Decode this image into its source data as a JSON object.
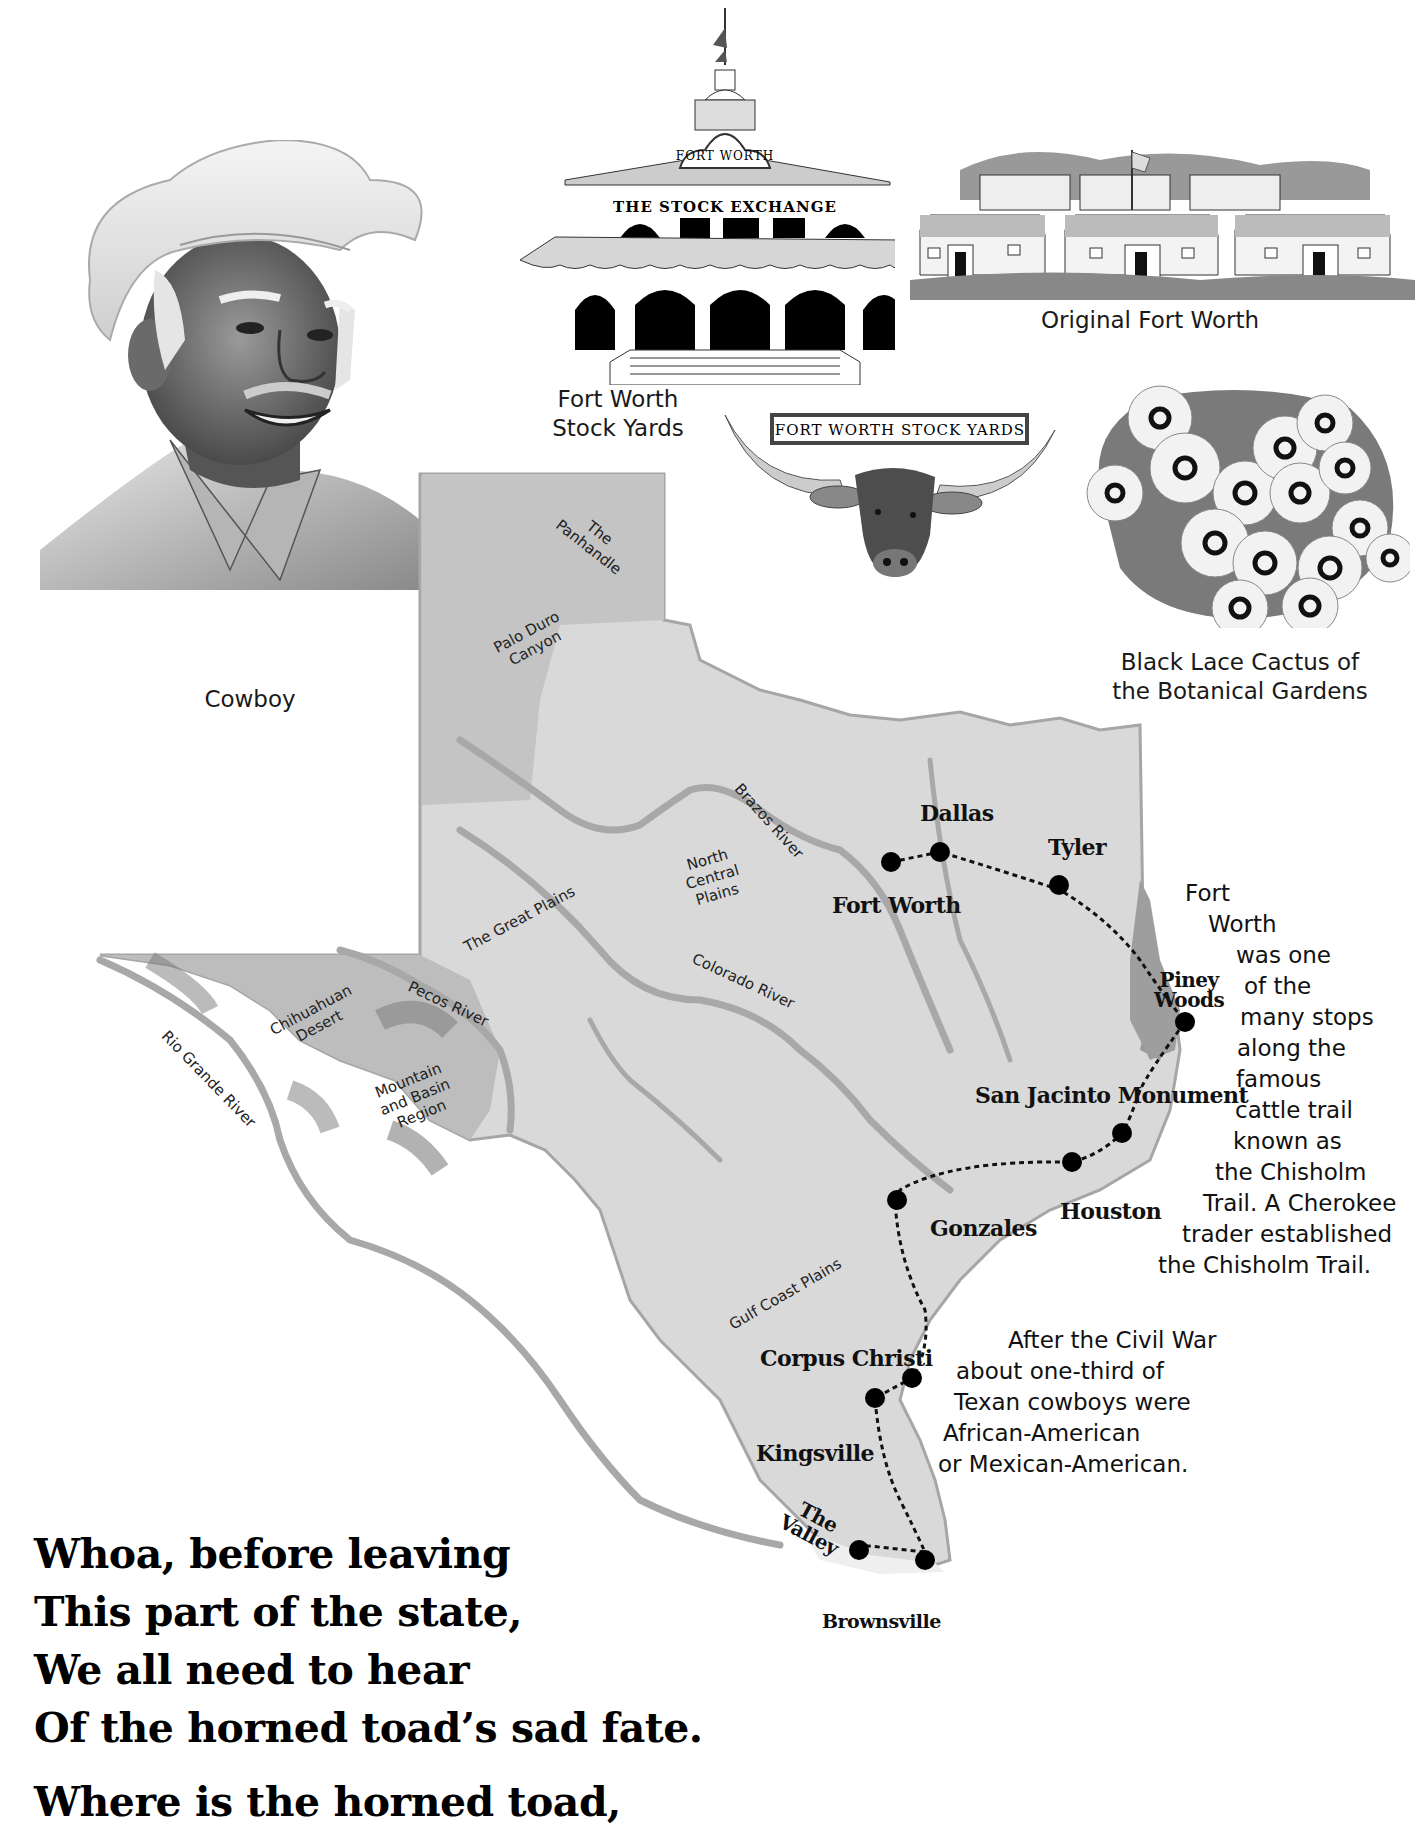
{
  "illustrations": {
    "cowboy": {
      "caption": "Cowboy"
    },
    "stock_exchange": {
      "arch_label": "FORT WORTH",
      "building_label": "THE STOCK EXCHANGE",
      "caption_line1": "Fort Worth",
      "caption_line2": "Stock Yards"
    },
    "original_fort": {
      "caption": "Original Fort Worth"
    },
    "longhorn": {
      "sign_label": "FORT WORTH STOCK YARDS"
    },
    "cactus": {
      "caption_line1": "Black Lace Cactus of",
      "caption_line2": "the Botanical Gardens"
    }
  },
  "map": {
    "regions": {
      "panhandle_1": "The",
      "panhandle_2": "Panhandle",
      "palo_duro_1": "Palo Duro",
      "palo_duro_2": "Canyon",
      "great_plains": "The Great Plains",
      "north_central_1": "North",
      "north_central_2": "Central",
      "north_central_3": "Plains",
      "chihuahuan_1": "Chihuahuan",
      "chihuahuan_2": "Desert",
      "mountain_basin_1": "Mountain",
      "mountain_basin_2": "and Basin",
      "mountain_basin_3": "Region",
      "gulf_coast": "Gulf Coast Plains",
      "piney_1": "Piney",
      "piney_2": "Woods",
      "valley_1": "The",
      "valley_2": "Valley"
    },
    "rivers": {
      "brazos": "Brazos River",
      "colorado": "Colorado River",
      "pecos": "Pecos River",
      "rio_grande": "Rio Grande River"
    },
    "cities": {
      "dallas": "Dallas",
      "fort_worth": "Fort Worth",
      "tyler": "Tyler",
      "san_jacinto": "San Jacinto Monument",
      "houston": "Houston",
      "gonzales": "Gonzales",
      "corpus_christi": "Corpus Christi",
      "kingsville": "Kingsville",
      "brownsville": "Brownsville"
    },
    "colors": {
      "land": "#d8d8d8",
      "land_light": "#e4e4e4",
      "panhandle": "#c9c9c9",
      "west": "#bdbdbd",
      "piney_woods": "#9a9a9a",
      "river": "#a8a8a8",
      "trail_dot": "#000000"
    }
  },
  "notes": {
    "chisholm": [
      "Fort",
      "Worth",
      "was one",
      "of the",
      "many stops",
      "along the",
      "famous",
      "cattle trail",
      "known as",
      "the Chisholm",
      "Trail. A Cherokee",
      "trader established",
      "the Chisholm Trail."
    ],
    "civil_war": [
      "After the Civil War",
      "about one-third of",
      "Texan cowboys were",
      "African-American",
      "or Mexican-American."
    ]
  },
  "poem": {
    "lines": [
      "Whoa, before leaving",
      "This part of the state,",
      "We all need to hear",
      "Of the horned toad’s sad fate.",
      "Where is the horned toad,"
    ]
  }
}
